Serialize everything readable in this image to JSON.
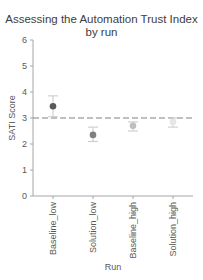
{
  "chart_data": {
    "type": "scatter",
    "title": "Assessing the Automation Trust Index by run",
    "title_lines": [
      "Assessing the Automation Trust Index",
      "by run"
    ],
    "xlabel": "Run",
    "ylabel": "SATI Score",
    "ylim": [
      0,
      6
    ],
    "yticks": [
      0,
      1,
      2,
      3,
      4,
      5,
      6
    ],
    "categories": [
      "Baseline_low",
      "Solution_low",
      "Baseline_high",
      "Solution_high"
    ],
    "values": [
      3.45,
      2.35,
      2.7,
      2.85
    ],
    "error_low": [
      3.05,
      2.1,
      2.5,
      2.65
    ],
    "error_high": [
      3.85,
      2.65,
      2.85,
      3.0
    ],
    "marker_colors": [
      "#595959",
      "#808080",
      "#bfbfbf",
      "#e6e6e6"
    ],
    "reference_line": {
      "y": 3,
      "style": "dashed",
      "color": "#808080"
    },
    "grid": false,
    "legend": "none"
  }
}
